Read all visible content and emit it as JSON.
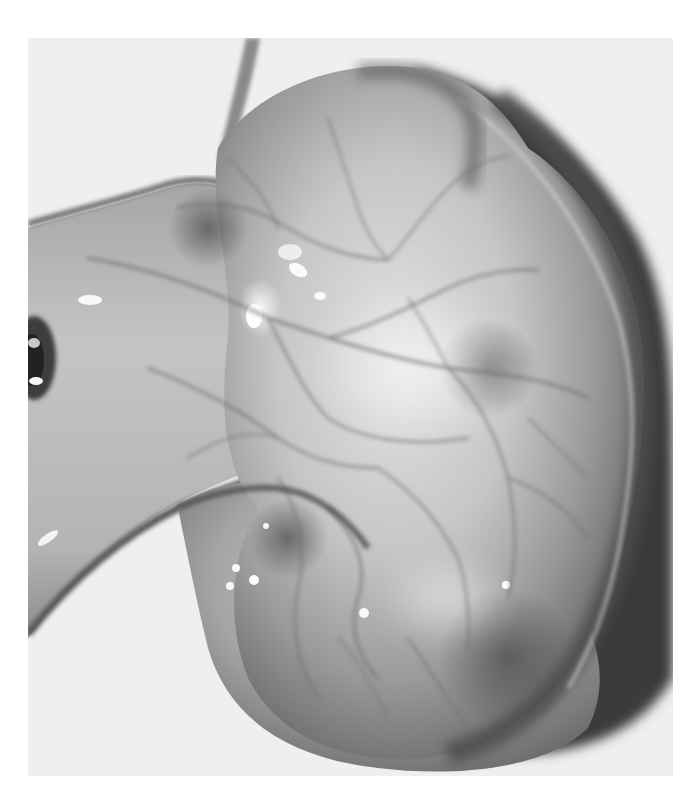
{
  "image": {
    "kind": "grayscale specimen photograph",
    "subject": "globular organ with tubular stalk and surface vessel network",
    "frame": {
      "x": 28,
      "y": 38,
      "width": 645,
      "height": 738
    },
    "colors": {
      "page_background": "#ffffff",
      "photo_background": "#f0f0f0",
      "tissue_light": "#d8d8d8",
      "tissue_mid": "#a8a8a8",
      "tissue_dark": "#6a6a6a",
      "shadow": "#3a3a3a",
      "highlight": "#fbfbfb",
      "vessel": "#6e6e6e"
    },
    "visible_text": []
  }
}
